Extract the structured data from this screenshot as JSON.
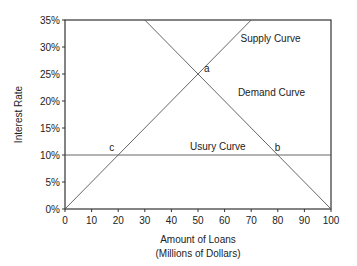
{
  "chart_data": {
    "type": "line",
    "title": "",
    "xlabel": "Amount of Loans",
    "xlabel_line2": "(Millions of Dollars)",
    "ylabel": "Interest Rate",
    "xlim": [
      0,
      100
    ],
    "ylim": [
      0,
      35
    ],
    "x_ticks": [
      0,
      10,
      20,
      30,
      40,
      50,
      60,
      70,
      80,
      90,
      100
    ],
    "x_tick_labels": [
      "0",
      "10",
      "20",
      "30",
      "40",
      "50",
      "60",
      "70",
      "80",
      "90",
      "100"
    ],
    "y_ticks": [
      0,
      5,
      10,
      15,
      20,
      25,
      30,
      35
    ],
    "y_tick_labels": [
      "0%",
      "5%",
      "10%",
      "15%",
      "20%",
      "25%",
      "30%",
      "35%"
    ],
    "grid": false,
    "series": [
      {
        "name": "Supply Curve",
        "points": [
          [
            0,
            0
          ],
          [
            70,
            35
          ]
        ]
      },
      {
        "name": "Demand Curve",
        "points": [
          [
            30,
            35
          ],
          [
            100,
            0
          ]
        ]
      },
      {
        "name": "Usury Curve",
        "points": [
          [
            0,
            10
          ],
          [
            100,
            10
          ]
        ]
      }
    ],
    "annotations": [
      {
        "text": "a",
        "x": 50,
        "y": 25
      },
      {
        "text": "b",
        "x": 80,
        "y": 10
      },
      {
        "text": "c",
        "x": 20,
        "y": 10
      },
      {
        "text": "Supply Curve",
        "x": 66,
        "y": 31
      },
      {
        "text": "Demand Curve",
        "x": 65,
        "y": 21
      },
      {
        "text": "Usury Curve",
        "x": 47,
        "y": 11
      }
    ]
  }
}
